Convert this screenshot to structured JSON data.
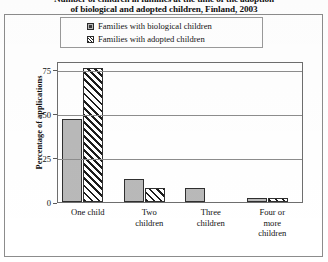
{
  "chart_data": {
    "type": "bar",
    "title_line1": "Number of children in families at the time of the adoption",
    "title_line2": "of biological and adopted children, Finland, 2003",
    "categories": [
      "One child",
      "Two children",
      "Three children",
      "Four or more children"
    ],
    "category_lines": [
      [
        "One child"
      ],
      [
        "Two",
        "children"
      ],
      [
        "Three",
        "children"
      ],
      [
        "Four or",
        "more",
        "children"
      ]
    ],
    "series": [
      {
        "name": "Families with biological children",
        "values": [
          47,
          13,
          8,
          2
        ],
        "pattern": "solid",
        "color": "#b9b9b9"
      },
      {
        "name": "Families with adopted children",
        "values": [
          76,
          8,
          0,
          2
        ],
        "pattern": "hatch",
        "color": "#ffffff"
      }
    ],
    "xlabel": "",
    "ylabel": "Percentage of applications",
    "ylim": [
      0,
      80
    ],
    "yticks": [
      0,
      25,
      50,
      75
    ],
    "ytick_labels": [
      "0",
      "25",
      "50",
      "75"
    ],
    "grid": true,
    "legend_position": "top"
  },
  "legend": {
    "items": [
      {
        "label": "Families with biological children",
        "swatch": "solid-swatch-icon"
      },
      {
        "label": "Families with adopted children",
        "swatch": "hatched-swatch-icon"
      }
    ]
  }
}
